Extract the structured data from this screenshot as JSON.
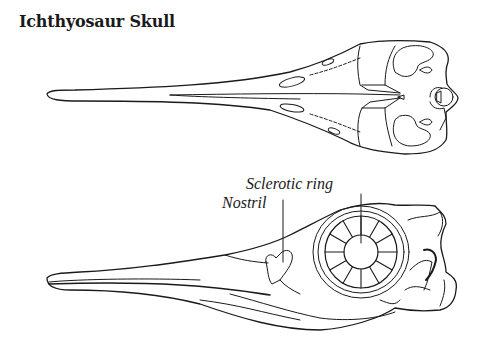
{
  "title": "Ichthyosaur Skull",
  "labels": {
    "sclerotic_ring": "Sclerotic ring",
    "nostril": "Nostril"
  },
  "views": [
    "dorsal-view",
    "lateral-view"
  ],
  "colors": {
    "ink": "#1a1a1a",
    "background": "#ffffff"
  }
}
